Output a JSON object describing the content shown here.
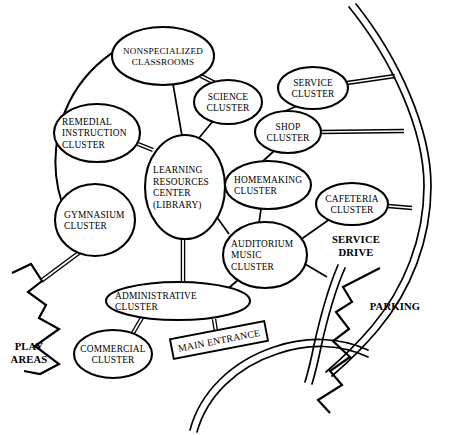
{
  "diagram": {
    "title": "School Facility Cluster Relationship Diagram",
    "stroke_color": "#000000",
    "background_color": "#ffffff",
    "nodes": [
      {
        "id": "nonspecialized",
        "name": "nonspecialized-classrooms",
        "lines": [
          "NONSPECIALIZED",
          "CLASSROOMS"
        ],
        "cx": 163,
        "cy": 56,
        "rx": 51,
        "ry": 29,
        "align": "middle",
        "label_size": "wide"
      },
      {
        "id": "science",
        "name": "science-cluster",
        "lines": [
          "SCIENCE",
          "CLUSTER"
        ],
        "cx": 228,
        "cy": 102,
        "rx": 34,
        "ry": 22,
        "align": "middle",
        "label_size": "normal"
      },
      {
        "id": "service",
        "name": "service-cluster",
        "lines": [
          "SERVICE",
          "CLUSTER"
        ],
        "cx": 313,
        "cy": 88,
        "rx": 35,
        "ry": 21,
        "align": "middle",
        "label_size": "normal"
      },
      {
        "id": "shop",
        "name": "shop-cluster",
        "lines": [
          "SHOP",
          "CLUSTER"
        ],
        "cx": 288,
        "cy": 132,
        "rx": 33,
        "ry": 21,
        "align": "middle",
        "label_size": "normal"
      },
      {
        "id": "remedial",
        "name": "remedial-instruction-cluster",
        "lines": [
          "REMEDIAL",
          "INSTRUCTION",
          "CLUSTER"
        ],
        "cx": 97,
        "cy": 133,
        "rx": 43,
        "ry": 29,
        "align": "start",
        "label_size": "normal"
      },
      {
        "id": "learning",
        "name": "learning-resources-center",
        "lines": [
          "LEARNING",
          "RESOURCES",
          "CENTER",
          "(LIBRARY)"
        ],
        "cx": 185,
        "cy": 187,
        "rx": 40,
        "ry": 52,
        "align": "start",
        "label_size": "normal"
      },
      {
        "id": "homemaking",
        "name": "homemaking-cluster",
        "lines": [
          "HOMEMAKING",
          "CLUSTER"
        ],
        "cx": 268,
        "cy": 185,
        "rx": 43,
        "ry": 24,
        "align": "start",
        "label_size": "normal"
      },
      {
        "id": "cafeteria",
        "name": "cafeteria-cluster",
        "lines": [
          "CAFETERIA",
          "CLUSTER"
        ],
        "cx": 352,
        "cy": 204,
        "rx": 36,
        "ry": 21,
        "align": "middle",
        "label_size": "normal"
      },
      {
        "id": "gymnasium",
        "name": "gymnasium-cluster",
        "lines": [
          "GYMNASIUM",
          "CLUSTER"
        ],
        "cx": 95,
        "cy": 220,
        "rx": 40,
        "ry": 36,
        "align": "start",
        "label_size": "normal"
      },
      {
        "id": "auditorium",
        "name": "auditorium-music-cluster",
        "lines": [
          "AUDITORIUM",
          "MUSIC",
          "CLUSTER"
        ],
        "cx": 265,
        "cy": 255,
        "rx": 42,
        "ry": 33,
        "align": "start",
        "label_size": "normal"
      },
      {
        "id": "administrative",
        "name": "administrative-cluster",
        "lines": [
          "ADMINISTRATIVE",
          "CLUSTER"
        ],
        "cx": 178,
        "cy": 301,
        "rx": 72,
        "ry": 19,
        "align": "start",
        "label_size": "normal"
      },
      {
        "id": "commercial",
        "name": "commercial-cluster",
        "lines": [
          "COMMERCIAL",
          "CLUSTER"
        ],
        "cx": 113,
        "cy": 354,
        "rx": 39,
        "ry": 24,
        "align": "middle",
        "label_size": "normal"
      }
    ],
    "edges_single": [
      {
        "name": "edge-nonspecialized-learning",
        "x1": 173,
        "y1": 84,
        "x2": 182,
        "y2": 136
      },
      {
        "name": "edge-science-learning",
        "x1": 213,
        "y1": 121,
        "x2": 194,
        "y2": 144
      },
      {
        "name": "edge-service-shop",
        "x1": 297,
        "y1": 106,
        "x2": 283,
        "y2": 112
      },
      {
        "name": "edge-shop-homemaking",
        "x1": 274,
        "y1": 151,
        "x2": 262,
        "y2": 162
      },
      {
        "name": "edge-homemaking-auditorium",
        "x1": 261,
        "y1": 209,
        "x2": 259,
        "y2": 223
      },
      {
        "name": "edge-cafeteria-auditorium",
        "x1": 330,
        "y1": 219,
        "x2": 300,
        "y2": 240
      },
      {
        "name": "edge-learning-auditorium",
        "x1": 216,
        "y1": 216,
        "x2": 229,
        "y2": 234
      },
      {
        "name": "edge-auditorium-servicedrive",
        "x1": 305,
        "y1": 264,
        "x2": 327,
        "y2": 277
      },
      {
        "name": "edge-auditorium-administrative",
        "x1": 238,
        "y1": 280,
        "x2": 224,
        "y2": 292
      }
    ],
    "edges_double": [
      {
        "name": "edge-nonspecialized-science-double",
        "x1": 201,
        "y1": 76,
        "x2": 219,
        "y2": 85,
        "offset": 3.0
      },
      {
        "name": "edge-remedial-learning-double",
        "x1": 138,
        "y1": 144,
        "x2": 153,
        "y2": 150,
        "offset": 3.0
      },
      {
        "name": "edge-learning-administrative-double",
        "x1": 183,
        "y1": 239,
        "x2": 183,
        "y2": 284,
        "offset": 3.2
      },
      {
        "name": "edge-administrative-commercial-double",
        "x1": 143,
        "y1": 316,
        "x2": 133,
        "y2": 333,
        "offset": 3.0
      },
      {
        "name": "edge-administrative-entrance-double",
        "x1": 214,
        "y1": 319,
        "x2": 219,
        "y2": 350,
        "offset": 3.2
      },
      {
        "name": "edge-gymnasium-boundary-double",
        "x1": 80,
        "y1": 252,
        "x2": 41,
        "y2": 281,
        "offset": 3.2
      },
      {
        "name": "edge-service-road-double",
        "x1": 347,
        "y1": 83,
        "x2": 395,
        "y2": 76,
        "offset": 3.0
      },
      {
        "name": "edge-shop-road-double",
        "x1": 321,
        "y1": 132,
        "x2": 404,
        "y2": 131,
        "offset": 3.0
      },
      {
        "name": "edge-cafeteria-road-double",
        "x1": 388,
        "y1": 206,
        "x2": 412,
        "y2": 208,
        "offset": 3.0
      }
    ],
    "arcs": [
      {
        "name": "campus-perimeter-arc",
        "path": "M 170 27 C 120 40 78 70 62 120 C 50 158 55 196 72 224"
      }
    ],
    "roads": [
      {
        "name": "outer-road-right",
        "path": "M 349 7 C 392 60 424 130 424 186 C 424 238 404 288 372 326 C 356 345 340 360 326 372"
      },
      {
        "name": "outer-road-right-inner-edge",
        "path": "M 356 4 C 399 58 431 129 431 186 C 431 240 411 291 378 330 C 362 349 346 364 332 376"
      },
      {
        "name": "service-drive-curve",
        "path": "M 338 265 C 327 291 320 318 314 345 C 311 360 308 372 305 382"
      },
      {
        "name": "service-drive-curve-inner",
        "path": "M 345 268 C 334 293 327 320 321 347 C 318 362 315 374 312 384"
      },
      {
        "name": "main-entrance-drive",
        "path": "M 190 430 C 200 392 232 361 274 347 C 306 336 340 337 368 350"
      },
      {
        "name": "main-entrance-drive-inner",
        "path": "M 197 432 C 207 396 237 367 277 354 C 308 343 341 344 368 357"
      }
    ],
    "boundaries": [
      {
        "name": "play-areas-boundary",
        "path": "M 12 273 L 31 264 L 42 281 L 28 292 L 46 305 L 39 318 L 59 329 L 35 346 L 59 364 L 40 374 L 24 371"
      },
      {
        "name": "parking-boundary",
        "path": "M 380 268 L 343 287 L 352 302 L 336 312 L 349 329 L 333 341 L 350 357 L 330 371 L 342 385 L 318 400 L 330 413"
      }
    ],
    "area_labels": [
      {
        "name": "play-areas-label",
        "lines": [
          "PLAY",
          "AREAS"
        ],
        "x": 29,
        "y": 352,
        "align": "middle"
      },
      {
        "name": "parking-label",
        "lines": [
          "PARKING"
        ],
        "x": 395,
        "y": 306,
        "align": "middle"
      },
      {
        "name": "service-drive-label",
        "lines": [
          "SERVICE",
          "DRIVE"
        ],
        "x": 356,
        "y": 245,
        "align": "middle"
      }
    ],
    "entrance": {
      "name": "main-entrance-sign",
      "label": "MAIN ENTRANCE",
      "cx": 219,
      "cy": 340,
      "width": 96,
      "height": 20,
      "rotation": -11
    }
  }
}
